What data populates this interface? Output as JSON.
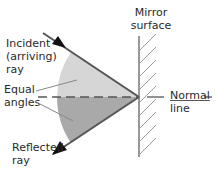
{
  "diagram": {
    "labels": {
      "mirror_line1": "Mirror",
      "mirror_line2": "surface",
      "incident_line1": "Incident",
      "incident_line2": "(arriving)",
      "incident_line3": "ray",
      "equal_line1": "Equal",
      "equal_line2": "angles",
      "reflected_line1": "Reflected",
      "reflected_line2": "ray",
      "normal_line1": "Normal",
      "normal_line2": "line"
    },
    "colors": {
      "ray": "#555555",
      "arrowhead": "#111111",
      "mirror": "#777777",
      "hatch": "#9a9a9a",
      "incident_angle_fill": "#d6d6d6",
      "reflected_angle_fill": "#a9a9a9",
      "normal_dash": "#555555",
      "leader": "#888888",
      "text": "#2a2a2a"
    }
  }
}
